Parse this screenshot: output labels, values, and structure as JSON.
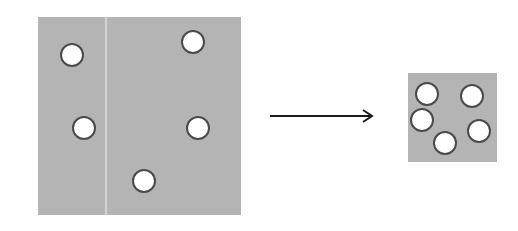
{
  "diagram": {
    "colors": {
      "square_fill": "#b4b4b4",
      "circle_fill": "#ffffff",
      "circle_stroke": "#4a4a4a",
      "divider": "#e6e6e6",
      "arrow": "#1a1a1a",
      "background": "#ffffff"
    },
    "large_square": {
      "x": 38,
      "y": 17,
      "width": 203,
      "height": 198,
      "divider_x": 106,
      "circles": [
        {
          "cx": 72,
          "cy": 55,
          "r": 11
        },
        {
          "cx": 193,
          "cy": 42,
          "r": 11
        },
        {
          "cx": 84,
          "cy": 128,
          "r": 11
        },
        {
          "cx": 198,
          "cy": 128,
          "r": 11
        },
        {
          "cx": 144,
          "cy": 181,
          "r": 11
        }
      ]
    },
    "arrow": {
      "x1": 270,
      "y1": 116,
      "x2": 372,
      "y2": 116
    },
    "small_square": {
      "x": 408,
      "y": 73,
      "width": 89,
      "height": 89,
      "circles": [
        {
          "cx": 427,
          "cy": 94,
          "r": 11
        },
        {
          "cx": 472,
          "cy": 96,
          "r": 11
        },
        {
          "cx": 422,
          "cy": 120,
          "r": 11
        },
        {
          "cx": 479,
          "cy": 131,
          "r": 11
        },
        {
          "cx": 445,
          "cy": 143,
          "r": 11
        }
      ]
    }
  }
}
